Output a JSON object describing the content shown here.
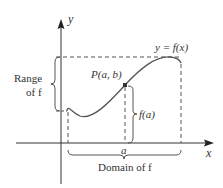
{
  "diagram": {
    "axes": {
      "x_label": "x",
      "y_label": "y"
    },
    "curve_label": "y = f(x)",
    "point_label": "P(a, b)",
    "point_x_label": "a",
    "height_label": "f(a)",
    "range_label_line1": "Range",
    "range_label_line2": "of f",
    "domain_label": "Domain of f",
    "colors": {
      "curve": "#555555",
      "axes": "#333333",
      "dashed": "#555555",
      "text": "#333333",
      "point": "#333333"
    }
  }
}
